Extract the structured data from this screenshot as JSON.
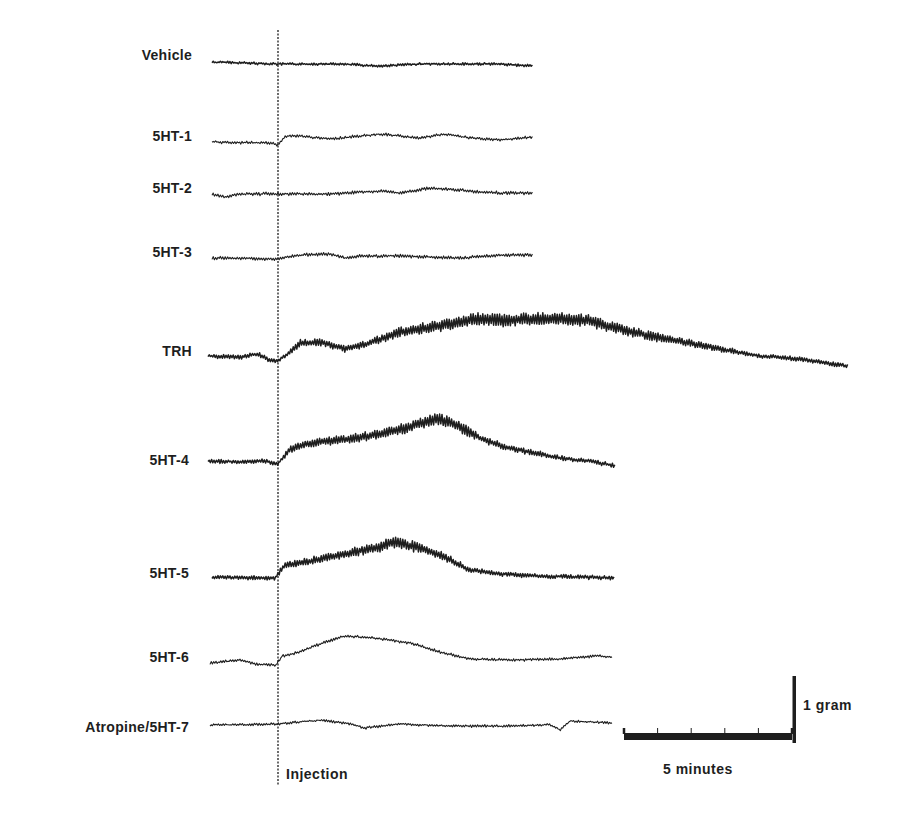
{
  "figure": {
    "injection_label": "Injection",
    "time_scale_label": "5 minutes",
    "force_scale_label": "1 gram"
  },
  "chart_data": {
    "type": "line",
    "title": "",
    "xlabel": "",
    "ylabel": "",
    "annotations": [
      "Injection",
      "5 minutes",
      "1 gram"
    ],
    "grid": false,
    "legend": "none",
    "x_units": "minutes (relative to injection at 0)",
    "y_units": "grams (force, offset per trace)",
    "scale_bars": {
      "time_minutes": 5,
      "force_grams": 1
    },
    "series": [
      {
        "name": "Vehicle",
        "baseline_y": 63,
        "start_x": 212,
        "end_x": 533,
        "oscillation": 2.0,
        "heavy": true,
        "points": [
          [
            212,
            62
          ],
          [
            278,
            64
          ],
          [
            340,
            64
          ],
          [
            380,
            66
          ],
          [
            420,
            64
          ],
          [
            460,
            64
          ],
          [
            500,
            64
          ],
          [
            533,
            66
          ]
        ]
      },
      {
        "name": "5HT-1",
        "baseline_y": 141,
        "start_x": 212,
        "end_x": 533,
        "oscillation": 1.2,
        "heavy": false,
        "points": [
          [
            212,
            142
          ],
          [
            270,
            143
          ],
          [
            278,
            145
          ],
          [
            285,
            136
          ],
          [
            300,
            136
          ],
          [
            330,
            139
          ],
          [
            380,
            134
          ],
          [
            420,
            138
          ],
          [
            445,
            134
          ],
          [
            470,
            138
          ],
          [
            500,
            140
          ],
          [
            533,
            137
          ]
        ]
      },
      {
        "name": "5HT-2",
        "baseline_y": 193,
        "start_x": 212,
        "end_x": 533,
        "oscillation": 1.5,
        "heavy": false,
        "points": [
          [
            212,
            194
          ],
          [
            225,
            197
          ],
          [
            240,
            194
          ],
          [
            278,
            194
          ],
          [
            330,
            194
          ],
          [
            380,
            191
          ],
          [
            400,
            193
          ],
          [
            430,
            188
          ],
          [
            470,
            191
          ],
          [
            500,
            193
          ],
          [
            533,
            193
          ]
        ]
      },
      {
        "name": "5HT-3",
        "baseline_y": 258,
        "start_x": 212,
        "end_x": 533,
        "oscillation": 1.5,
        "heavy": false,
        "points": [
          [
            212,
            258
          ],
          [
            278,
            259
          ],
          [
            300,
            255
          ],
          [
            330,
            254
          ],
          [
            345,
            258
          ],
          [
            360,
            256
          ],
          [
            400,
            256
          ],
          [
            460,
            258
          ],
          [
            500,
            255
          ],
          [
            533,
            255
          ]
        ]
      },
      {
        "name": "TRH",
        "baseline_y": 356,
        "start_x": 208,
        "end_x": 848,
        "oscillation": 4.5,
        "heavy": true,
        "points": [
          [
            208,
            356
          ],
          [
            240,
            357
          ],
          [
            258,
            354
          ],
          [
            270,
            360
          ],
          [
            278,
            361
          ],
          [
            290,
            352
          ],
          [
            300,
            343
          ],
          [
            320,
            342
          ],
          [
            345,
            349
          ],
          [
            370,
            343
          ],
          [
            400,
            332
          ],
          [
            440,
            326
          ],
          [
            475,
            319
          ],
          [
            510,
            320
          ],
          [
            560,
            318
          ],
          [
            590,
            321
          ],
          [
            615,
            328
          ],
          [
            650,
            336
          ],
          [
            690,
            343
          ],
          [
            725,
            350
          ],
          [
            760,
            356
          ],
          [
            800,
            359
          ],
          [
            848,
            366
          ]
        ]
      },
      {
        "name": "5HT-4",
        "baseline_y": 461,
        "start_x": 208,
        "end_x": 615,
        "oscillation": 4.0,
        "heavy": true,
        "points": [
          [
            208,
            461
          ],
          [
            240,
            462
          ],
          [
            265,
            461
          ],
          [
            278,
            464
          ],
          [
            290,
            449
          ],
          [
            310,
            443
          ],
          [
            340,
            440
          ],
          [
            375,
            435
          ],
          [
            410,
            427
          ],
          [
            435,
            419
          ],
          [
            455,
            424
          ],
          [
            480,
            438
          ],
          [
            505,
            447
          ],
          [
            530,
            452
          ],
          [
            560,
            458
          ],
          [
            590,
            461
          ],
          [
            615,
            466
          ]
        ]
      },
      {
        "name": "5HT-5",
        "baseline_y": 577,
        "start_x": 212,
        "end_x": 615,
        "oscillation": 4.0,
        "heavy": true,
        "points": [
          [
            212,
            577
          ],
          [
            250,
            578
          ],
          [
            275,
            578
          ],
          [
            285,
            565
          ],
          [
            310,
            561
          ],
          [
            345,
            554
          ],
          [
            375,
            548
          ],
          [
            395,
            542
          ],
          [
            420,
            548
          ],
          [
            445,
            557
          ],
          [
            470,
            570
          ],
          [
            500,
            574
          ],
          [
            540,
            576
          ],
          [
            580,
            577
          ],
          [
            615,
            578
          ]
        ]
      },
      {
        "name": "5HT-6",
        "baseline_y": 662,
        "start_x": 210,
        "end_x": 613,
        "oscillation": 1.2,
        "heavy": false,
        "points": [
          [
            210,
            663
          ],
          [
            240,
            660
          ],
          [
            255,
            664
          ],
          [
            276,
            665
          ],
          [
            282,
            656
          ],
          [
            300,
            652
          ],
          [
            325,
            642
          ],
          [
            345,
            636
          ],
          [
            375,
            638
          ],
          [
            410,
            643
          ],
          [
            440,
            652
          ],
          [
            470,
            659
          ],
          [
            510,
            660
          ],
          [
            560,
            659
          ],
          [
            595,
            656
          ],
          [
            613,
            657
          ]
        ]
      },
      {
        "name": "Atropine/5HT-7",
        "baseline_y": 724,
        "start_x": 210,
        "end_x": 613,
        "oscillation": 1.0,
        "heavy": false,
        "points": [
          [
            210,
            725
          ],
          [
            278,
            724
          ],
          [
            320,
            720
          ],
          [
            350,
            724
          ],
          [
            365,
            728
          ],
          [
            400,
            724
          ],
          [
            450,
            726
          ],
          [
            500,
            726
          ],
          [
            550,
            725
          ],
          [
            560,
            730
          ],
          [
            570,
            721
          ],
          [
            613,
            723
          ]
        ]
      }
    ]
  },
  "labels": [
    {
      "text": "Vehicle",
      "right_x": 192,
      "y": 56
    },
    {
      "text": "5HT-1",
      "right_x": 192,
      "y": 137
    },
    {
      "text": "5HT-2",
      "right_x": 192,
      "y": 189
    },
    {
      "text": "5HT-3",
      "right_x": 192,
      "y": 253
    },
    {
      "text": "TRH",
      "right_x": 192,
      "y": 352
    },
    {
      "text": "5HT-4",
      "right_x": 189,
      "y": 461
    },
    {
      "text": "5HT-5",
      "right_x": 189,
      "y": 574
    },
    {
      "text": "5HT-6",
      "right_x": 189,
      "y": 658
    },
    {
      "text": "Atropine/5HT-7",
      "right_x": 189,
      "y": 728
    }
  ],
  "layout": {
    "injection_x": 278,
    "injection_y_top": 30,
    "injection_y_bottom": 786,
    "time_bar": {
      "x1": 624,
      "x2": 792,
      "y": 737,
      "ticks": 5
    },
    "force_bar": {
      "x": 794,
      "y1": 676,
      "y2": 743
    },
    "ink_color": "#1e1e1e"
  }
}
